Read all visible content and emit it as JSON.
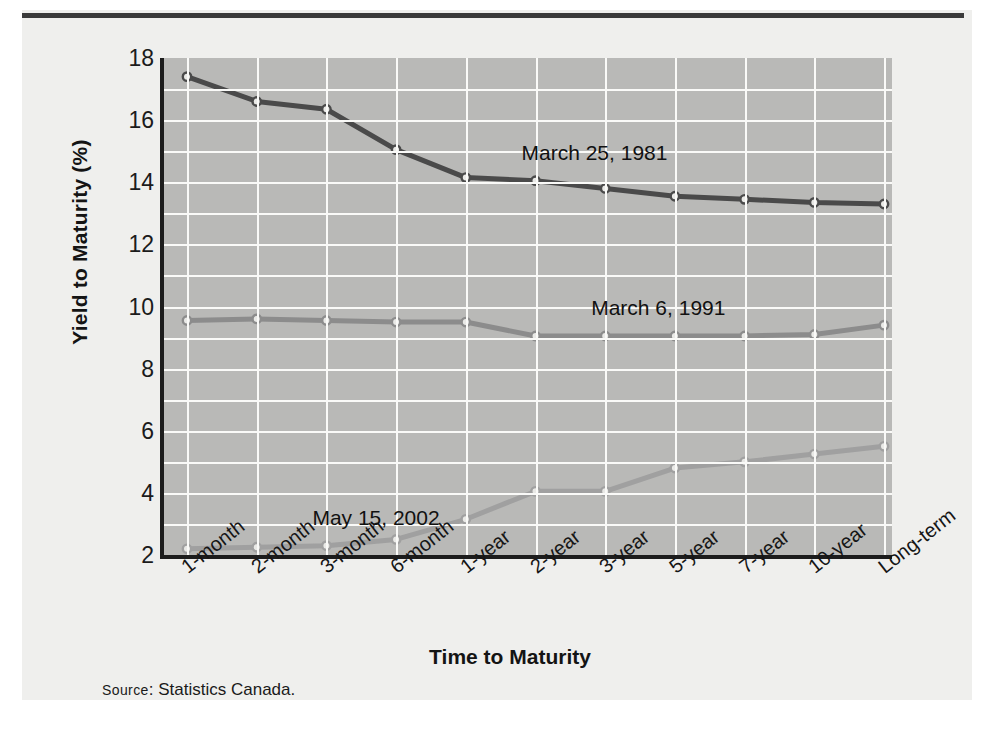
{
  "figure": {
    "source_prefix": "Source",
    "source_text": ": Statistics Canada."
  },
  "chart_data": {
    "type": "line",
    "title": "",
    "xlabel": "Time to Maturity",
    "ylabel": "Yield to Maturity (%)",
    "categories": [
      "1-month",
      "2-month",
      "3-month",
      "6-month",
      "1-year",
      "2-year",
      "3-year",
      "5-year",
      "7-year",
      "10-year",
      "Long-term"
    ],
    "ylim": [
      2,
      18
    ],
    "yticks": [
      2,
      4,
      6,
      8,
      10,
      12,
      14,
      16,
      18
    ],
    "ytick_labels": [
      "2",
      "4",
      "6",
      "8",
      "10",
      "12",
      "14",
      "16",
      "18"
    ],
    "grid": "minor-gridlines every 1 unit vertical, gridline at each category horizontal",
    "legend": "inline annotations next to each curve",
    "plot_background": "#b9b9b7",
    "gridline_color": "#fafaf8",
    "series": [
      {
        "name": "March 25, 1981",
        "color": "#4a4a4a",
        "label_x_category": "2-year",
        "values": [
          17.4,
          16.6,
          16.35,
          15.05,
          14.15,
          14.05,
          13.8,
          13.55,
          13.45,
          13.35,
          13.3
        ]
      },
      {
        "name": "March 6, 1991",
        "color": "#8c8c8c",
        "label_x_category": "3-year",
        "values": [
          9.55,
          9.6,
          9.55,
          9.5,
          9.5,
          9.05,
          9.05,
          9.05,
          9.05,
          9.1,
          9.4
        ]
      },
      {
        "name": "May 15, 2002",
        "color": "#a0a0a0",
        "label_x_category": "3-month",
        "values": [
          2.2,
          2.25,
          2.3,
          2.5,
          3.15,
          4.05,
          4.05,
          4.8,
          5.0,
          5.25,
          5.5
        ]
      }
    ]
  }
}
